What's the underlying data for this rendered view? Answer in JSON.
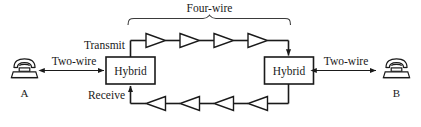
{
  "diagram": {
    "title_label": "Four-wire",
    "labels": {
      "transmit": "Transmit",
      "receive": "Receive",
      "two_wire_left": "Two-wire",
      "two_wire_right": "Two-wire"
    },
    "hybrid_left": {
      "label": "Hybrid"
    },
    "hybrid_right": {
      "label": "Hybrid"
    },
    "endpoints": [
      {
        "name": "phone-a",
        "label": "A",
        "icon": "telephone-icon"
      },
      {
        "name": "phone-b",
        "label": "B",
        "icon": "telephone-icon"
      }
    ],
    "transmit_path": {
      "direction": "left-to-right",
      "amplifier_count": 4,
      "amplifier_icon": "amplifier-triangle-right-icon"
    },
    "receive_path": {
      "direction": "right-to-left",
      "amplifier_count": 4,
      "amplifier_icon": "amplifier-triangle-left-icon"
    },
    "colors": {
      "line": "#1a1a1a",
      "background": "#ffffff",
      "brace": "#3a3a3a"
    }
  }
}
